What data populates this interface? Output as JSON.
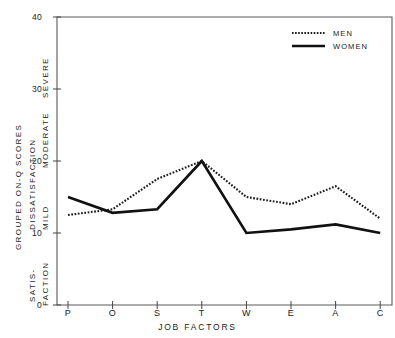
{
  "chart_data": {
    "type": "line",
    "title": "",
    "xlabel": "JOB FACTORS",
    "ylabel": "GROUPED ON-Q SCORES",
    "categories": [
      "P",
      "O",
      "S",
      "T",
      "W",
      "E",
      "A",
      "C"
    ],
    "series": [
      {
        "name": "MEN",
        "style": "dotted",
        "color": "#1a1a1a",
        "values": [
          12.5,
          13.3,
          17.5,
          20.0,
          15.0,
          14.0,
          16.5,
          12.0
        ]
      },
      {
        "name": "WOMEN",
        "style": "solid",
        "color": "#111111",
        "values": [
          15.0,
          12.8,
          13.3,
          20.0,
          10.0,
          10.5,
          11.2,
          10.0
        ]
      }
    ],
    "ylim": [
      0,
      40
    ],
    "yticks": [
      0,
      10,
      20,
      30,
      40
    ],
    "ytick_labels": [
      "0",
      "10",
      "20",
      "30",
      "40"
    ],
    "grid": false,
    "legend_position": "top-right"
  },
  "axes": {
    "y_outer_label": "GROUPED ON-Q SCORES",
    "y_group_upper": "DISSATISFACTION",
    "y_group_lower": "SATIS-",
    "y_group_lower2": "FACTION",
    "y_band_severe": "SEVERE",
    "y_band_moderate": "MODERATE",
    "y_band_mild": "MILD",
    "x_title": "JOB FACTORS"
  },
  "legend": {
    "items": [
      {
        "label": "MEN",
        "style": "dotted"
      },
      {
        "label": "WOMEN",
        "style": "solid"
      }
    ]
  }
}
